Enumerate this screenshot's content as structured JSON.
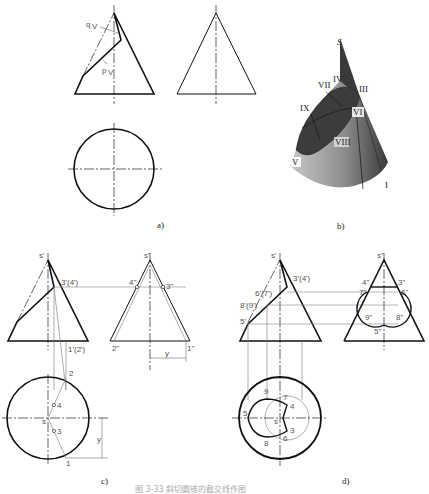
{
  "figure": {
    "caption": "图 3-33   斜切圆锥的截交线作图",
    "panels": [
      {
        "id": "a",
        "label": "a)",
        "labels": {
          "q": "q",
          "q_sub": "V",
          "p": "p",
          "p_sub": "V"
        }
      },
      {
        "id": "b",
        "label": "b)",
        "points": [
          "S",
          "IV",
          "VII",
          "III",
          "IX",
          "VI",
          "VIII",
          "V",
          "I"
        ]
      },
      {
        "id": "c",
        "label": "c)",
        "front": {
          "apex": "s'",
          "p34": "3'(4')",
          "p12": "1'(2')"
        },
        "side": {
          "apex": "s\"",
          "p4": "4\"",
          "p3": "3\"",
          "p2": "2\"",
          "p1": "1\"",
          "dim": "y",
          "dim_sub": "1"
        },
        "top": {
          "s": "s",
          "p2": "2",
          "p4": "4",
          "p3": "3",
          "p1": "1",
          "dim": "y",
          "dim_sub": "1"
        }
      },
      {
        "id": "d",
        "label": "d)",
        "front": {
          "apex": "s'",
          "p34": "3'(4')",
          "p67": "6'(7')",
          "p89": "8'(9')",
          "p5": "5'"
        },
        "side": {
          "apex": "s\"",
          "p4": "4\"",
          "p3": "3\"",
          "p7": "7\"",
          "p6": "6\"",
          "p9": "9\"",
          "p8": "8\"",
          "p5": "5\""
        },
        "top": {
          "p9": "9",
          "p7": "7",
          "p4": "4",
          "p5": "5",
          "s": "s",
          "p3": "3",
          "p6": "6",
          "p8": "8"
        }
      }
    ]
  },
  "colors": {
    "line": "#111111",
    "thin": "#666666",
    "cone_dark": "#3a3a3a",
    "cone_mid": "#8a8a8a",
    "cone_light": "#c4c4c4"
  }
}
